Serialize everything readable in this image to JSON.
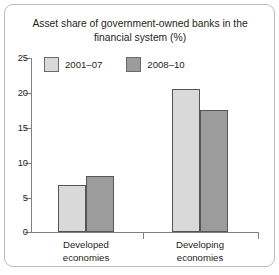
{
  "chart_data": {
    "type": "bar",
    "title": "Asset share of government-owned banks in the financial system (%)",
    "xlabel": "",
    "ylabel": "",
    "ylim": [
      0,
      25
    ],
    "yticks": [
      0,
      5,
      10,
      15,
      20,
      25
    ],
    "grid": false,
    "legend_position": "top-left",
    "categories": [
      "Developed economies",
      "Developing economies"
    ],
    "series": [
      {
        "name": "2001–07",
        "color": "#d9d9d9",
        "values": [
          6.8,
          20.5
        ]
      },
      {
        "name": "2008–10",
        "color": "#9c9c9c",
        "values": [
          8.1,
          17.5
        ]
      }
    ]
  },
  "figure": {
    "title_line1": "Asset share of government-owned banks in the",
    "title_line2": "financial system (%)",
    "legend": [
      {
        "label": "2001–07",
        "color": "#d9d9d9"
      },
      {
        "label": "2008–10",
        "color": "#9c9c9c"
      }
    ],
    "y_tick_labels": [
      "25",
      "20",
      "15",
      "10",
      "5",
      "0"
    ],
    "category_labels": [
      {
        "line1": "Developed",
        "line2": "economies"
      },
      {
        "line1": "Developing",
        "line2": "economies"
      }
    ]
  }
}
